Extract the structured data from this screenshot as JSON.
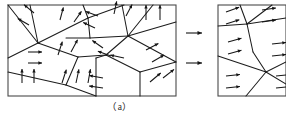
{
  "figure": {
    "caption": "（a）",
    "type": "magnetic-domain-schematic",
    "colors": {
      "frame": "#4a4a4a",
      "edge": "#1c1c1c",
      "arrow": "#151515",
      "background": "#ffffff"
    }
  },
  "panels": {
    "left": {
      "name": "(a)",
      "x": 8,
      "y": 5,
      "width": 168,
      "height": 91,
      "grain_edges": [
        [
          [
            8,
            5
          ],
          [
            38,
            43
          ]
        ],
        [
          [
            38,
            43
          ],
          [
            8,
            58
          ]
        ],
        [
          [
            38,
            43
          ],
          [
            30,
            5
          ]
        ],
        [
          [
            38,
            43
          ],
          [
            78,
            57
          ]
        ],
        [
          [
            38,
            43
          ],
          [
            88,
            18
          ]
        ],
        [
          [
            88,
            18
          ],
          [
            83,
            5
          ]
        ],
        [
          [
            88,
            18
          ],
          [
            124,
            5
          ]
        ],
        [
          [
            88,
            18
          ],
          [
            90,
            38
          ]
        ],
        [
          [
            90,
            38
          ],
          [
            66,
            38
          ]
        ],
        [
          [
            90,
            38
          ],
          [
            128,
            36
          ]
        ],
        [
          [
            128,
            36
          ],
          [
            122,
            5
          ]
        ],
        [
          [
            128,
            36
          ],
          [
            153,
            5
          ]
        ],
        [
          [
            128,
            36
          ],
          [
            176,
            22
          ]
        ],
        [
          [
            128,
            36
          ],
          [
            176,
            62
          ]
        ],
        [
          [
            128,
            36
          ],
          [
            106,
            55
          ]
        ],
        [
          [
            106,
            55
          ],
          [
            78,
            57
          ]
        ],
        [
          [
            78,
            57
          ],
          [
            66,
            85
          ]
        ],
        [
          [
            66,
            85
          ],
          [
            8,
            72
          ]
        ],
        [
          [
            66,
            85
          ],
          [
            96,
            96
          ]
        ],
        [
          [
            96,
            96
          ],
          [
            96,
            58
          ]
        ],
        [
          [
            96,
            58
          ],
          [
            106,
            55
          ]
        ],
        [
          [
            106,
            55
          ],
          [
            140,
            72
          ]
        ],
        [
          [
            140,
            72
          ],
          [
            176,
            62
          ]
        ],
        [
          [
            140,
            72
          ],
          [
            140,
            96
          ]
        ]
      ],
      "domain_arrows": [
        {
          "x": 34,
          "y": 13,
          "angle": -140,
          "len": 13
        },
        {
          "x": 29,
          "y": 25,
          "angle": -150,
          "len": 13
        },
        {
          "x": 60,
          "y": 20,
          "angle": -75,
          "len": 13
        },
        {
          "x": 74,
          "y": 22,
          "angle": -55,
          "len": 13
        },
        {
          "x": 28,
          "y": 52,
          "angle": 0,
          "len": 14
        },
        {
          "x": 28,
          "y": 63,
          "angle": 0,
          "len": 14
        },
        {
          "x": 58,
          "y": 55,
          "angle": -72,
          "len": 14
        },
        {
          "x": 71,
          "y": 52,
          "angle": -62,
          "len": 14
        },
        {
          "x": 22,
          "y": 83,
          "angle": -90,
          "len": 14
        },
        {
          "x": 34,
          "y": 83,
          "angle": -90,
          "len": 14
        },
        {
          "x": 62,
          "y": 83,
          "angle": -72,
          "len": 14
        },
        {
          "x": 76,
          "y": 83,
          "angle": -78,
          "len": 14
        },
        {
          "x": 88,
          "y": 83,
          "angle": -80,
          "len": 14
        },
        {
          "x": 98,
          "y": 16,
          "angle": -160,
          "len": 13
        },
        {
          "x": 95,
          "y": 28,
          "angle": -155,
          "len": 13
        },
        {
          "x": 114,
          "y": 14,
          "angle": -78,
          "len": 13
        },
        {
          "x": 126,
          "y": 16,
          "angle": -62,
          "len": 13
        },
        {
          "x": 103,
          "y": 48,
          "angle": -145,
          "len": 13
        },
        {
          "x": 146,
          "y": 20,
          "angle": -90,
          "len": 15
        },
        {
          "x": 160,
          "y": 20,
          "angle": -90,
          "len": 15
        },
        {
          "x": 111,
          "y": 56,
          "angle": -160,
          "len": 14
        },
        {
          "x": 124,
          "y": 58,
          "angle": -168,
          "len": 14
        },
        {
          "x": 146,
          "y": 50,
          "angle": -28,
          "len": 14
        },
        {
          "x": 152,
          "y": 62,
          "angle": -30,
          "len": 14
        },
        {
          "x": 103,
          "y": 78,
          "angle": -170,
          "len": 14
        },
        {
          "x": 103,
          "y": 88,
          "angle": -172,
          "len": 14
        },
        {
          "x": 150,
          "y": 82,
          "angle": -40,
          "len": 14
        },
        {
          "x": 163,
          "y": 78,
          "angle": -38,
          "len": 14
        }
      ]
    },
    "right": {
      "x": 218,
      "y": 5,
      "width": 68,
      "height": 91,
      "grain_edges": [
        [
          [
            218,
            26
          ],
          [
            247,
            24
          ]
        ],
        [
          [
            247,
            24
          ],
          [
            240,
            5
          ]
        ],
        [
          [
            247,
            24
          ],
          [
            272,
            5
          ]
        ],
        [
          [
            247,
            24
          ],
          [
            286,
            18
          ]
        ],
        [
          [
            247,
            24
          ],
          [
            253,
            52
          ]
        ],
        [
          [
            253,
            52
          ],
          [
            266,
            72
          ]
        ],
        [
          [
            266,
            72
          ],
          [
            286,
            62
          ]
        ],
        [
          [
            266,
            72
          ],
          [
            218,
            56
          ]
        ],
        [
          [
            266,
            72
          ],
          [
            286,
            84
          ]
        ],
        [
          [
            266,
            72
          ],
          [
            246,
            96
          ]
        ]
      ],
      "domain_arrows": [
        {
          "x": 226,
          "y": 12,
          "angle": -20,
          "len": 14
        },
        {
          "x": 226,
          "y": 24,
          "angle": -18,
          "len": 14
        },
        {
          "x": 262,
          "y": 10,
          "angle": -8,
          "len": 14
        },
        {
          "x": 262,
          "y": 22,
          "angle": -8,
          "len": 14
        },
        {
          "x": 228,
          "y": 42,
          "angle": -16,
          "len": 14
        },
        {
          "x": 228,
          "y": 54,
          "angle": -16,
          "len": 14
        },
        {
          "x": 272,
          "y": 44,
          "angle": -6,
          "len": 14
        },
        {
          "x": 272,
          "y": 56,
          "angle": -6,
          "len": 14
        },
        {
          "x": 226,
          "y": 76,
          "angle": -6,
          "len": 14
        },
        {
          "x": 226,
          "y": 88,
          "angle": -6,
          "len": 14
        },
        {
          "x": 276,
          "y": 76,
          "angle": -6,
          "len": 14
        },
        {
          "x": 276,
          "y": 88,
          "angle": -6,
          "len": 14
        }
      ]
    }
  },
  "transition_arrows": [
    {
      "name": "transition-arrow-top",
      "x1": 186,
      "y1": 33,
      "x2": 202,
      "y2": 33
    },
    {
      "name": "transition-arrow-bottom",
      "x1": 186,
      "y1": 63,
      "x2": 202,
      "y2": 63
    }
  ],
  "caption": {
    "label": "（a）",
    "x": 120,
    "y": 110
  }
}
